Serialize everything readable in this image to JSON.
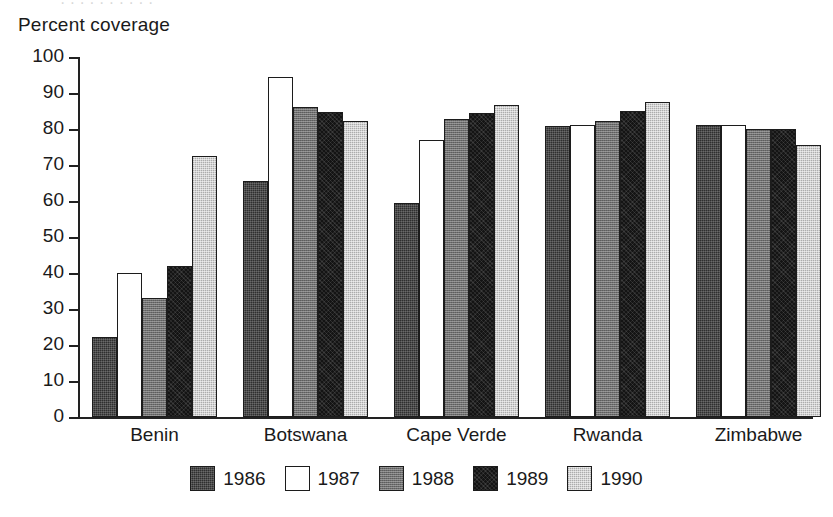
{
  "scan": {
    "top_cut_text": "· · · · · · · · · ·"
  },
  "chart_data": {
    "type": "bar",
    "title": "",
    "ylabel": "Percent coverage",
    "xlabel": "",
    "ylim": [
      0,
      100
    ],
    "yticks": [
      0,
      10,
      20,
      30,
      40,
      50,
      60,
      70,
      80,
      90,
      100
    ],
    "ytick_labels": [
      "0",
      "10",
      "20",
      "30",
      "40",
      "50",
      "60",
      "70",
      "80",
      "90",
      "100"
    ],
    "grid": false,
    "legend_position": "bottom-center",
    "categories": [
      "Benin",
      "Botswana",
      "Cape Verde",
      "Rwanda",
      "Zimbabwe"
    ],
    "series": [
      {
        "name": "1986",
        "color": "#2f2f2f",
        "values": [
          22.2,
          65.6,
          59.4,
          80.8,
          81.1
        ]
      },
      {
        "name": "1987",
        "color": "#ffffff",
        "values": [
          40.0,
          94.4,
          76.9,
          81.1,
          81.1
        ]
      },
      {
        "name": "1988",
        "color": "#6f6f6f",
        "values": [
          33.1,
          86.1,
          82.8,
          82.2,
          80.0
        ]
      },
      {
        "name": "1989",
        "color": "#141414",
        "values": [
          41.9,
          84.7,
          84.4,
          85.0,
          80.0
        ]
      },
      {
        "name": "1990",
        "color": "#d2d2d2",
        "values": [
          72.5,
          82.2,
          86.7,
          87.5,
          75.6
        ]
      }
    ]
  },
  "legend": {
    "items": [
      {
        "label": "1986",
        "swatch": "legend-swatch-1986"
      },
      {
        "label": "1987",
        "swatch": "legend-swatch-1987"
      },
      {
        "label": "1988",
        "swatch": "legend-swatch-1988"
      },
      {
        "label": "1989",
        "swatch": "legend-swatch-1989"
      },
      {
        "label": "1990",
        "swatch": "legend-swatch-1990"
      }
    ]
  }
}
